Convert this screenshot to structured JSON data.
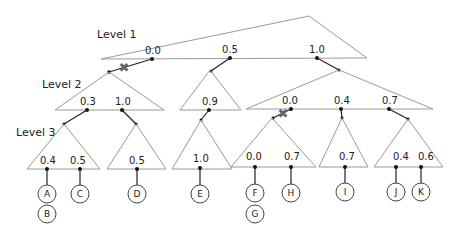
{
  "levels": {
    "level1": "Level 1",
    "level2": "Level 2",
    "level3": "Level 3"
  },
  "level1_keys": [
    "0.0",
    "0.5",
    "1.0"
  ],
  "level2_keys": {
    "left": [
      "0.3",
      "1.0"
    ],
    "middle": [
      "0.9"
    ],
    "right": [
      "0.0",
      "0.4",
      "0.7"
    ]
  },
  "level3_keys": {
    "t1": [
      "0.4",
      "0.5"
    ],
    "t2": [
      "0.5"
    ],
    "t3": [
      "1.0"
    ],
    "t4": [
      "0.0",
      "0.7"
    ],
    "t5": [
      "0.7"
    ],
    "t6": [
      "0.4",
      "0.6"
    ]
  },
  "leaves": [
    "A",
    "B",
    "C",
    "D",
    "E",
    "F",
    "G",
    "H",
    "I",
    "J",
    "K"
  ],
  "marks": {
    "invalid_pointer": "✖"
  },
  "colors": {
    "triangle": "#9a9a9a",
    "pointer": "#222222",
    "x_mark": "#666666"
  }
}
